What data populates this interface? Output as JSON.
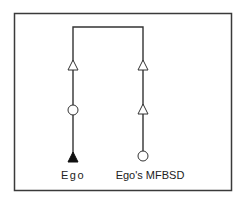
{
  "diagram": {
    "type": "kinship-chart",
    "frame": true,
    "line_color": "#333333",
    "symbols": {
      "triangle": "male",
      "circle": "female",
      "filled": "ego"
    },
    "lines": [
      {
        "name": "ego-line",
        "label": "Ego",
        "nodes_top_to_bottom": [
          {
            "shape": "triangle",
            "filled": false
          },
          {
            "shape": "circle",
            "filled": false
          },
          {
            "shape": "triangle",
            "filled": true
          }
        ]
      },
      {
        "name": "relative-line",
        "label": "Ego's MFBSD",
        "nodes_top_to_bottom": [
          {
            "shape": "triangle",
            "filled": false
          },
          {
            "shape": "triangle",
            "filled": false
          },
          {
            "shape": "circle",
            "filled": false
          }
        ]
      }
    ]
  }
}
